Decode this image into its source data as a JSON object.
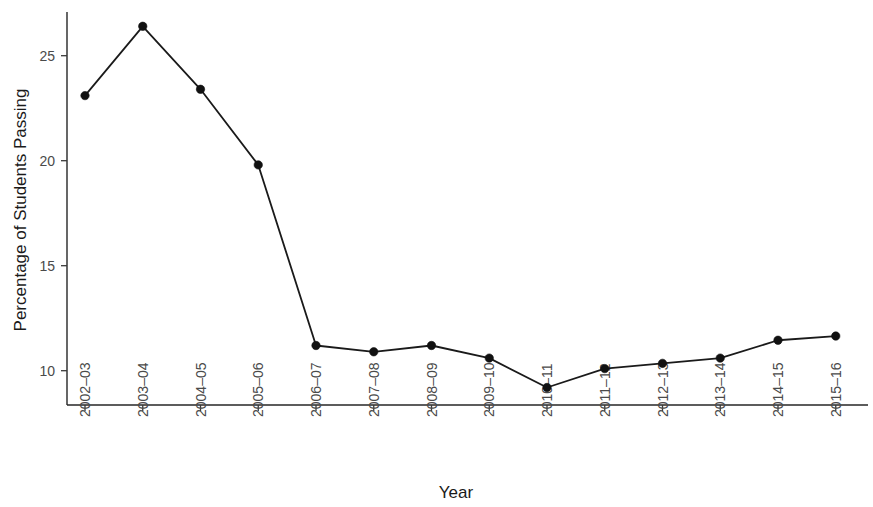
{
  "chart_data": {
    "type": "line",
    "title": "",
    "xlabel": "Year",
    "ylabel": "Percentage of Students Passing",
    "categories": [
      "2002–03",
      "2003–04",
      "2004–05",
      "2005–06",
      "2006–07",
      "2007–08",
      "2008–09",
      "2009–10",
      "2010–11",
      "2011–12",
      "2012–13",
      "2013–14",
      "2014–15",
      "2015–16"
    ],
    "values": [
      23.1,
      26.4,
      23.4,
      19.8,
      11.2,
      10.9,
      11.2,
      10.6,
      9.2,
      10.1,
      10.35,
      10.6,
      11.45,
      11.65
    ],
    "series": [
      {
        "name": "Percentage of Students Passing",
        "values": [
          23.1,
          26.4,
          23.4,
          19.8,
          11.2,
          10.9,
          11.2,
          10.6,
          9.2,
          10.1,
          10.35,
          10.6,
          11.45,
          11.65
        ]
      }
    ],
    "y_ticks": [
      10,
      15,
      20,
      25
    ],
    "y_tick_labels": [
      "10",
      "15",
      "20",
      "25"
    ],
    "ylim": [
      8.6,
      27.3
    ],
    "xlim_categories": 14,
    "grid": false,
    "legend": "none",
    "marker": "filled-circle",
    "line_color": "#1a1a1a",
    "marker_color": "#111111",
    "background_color": "#ffffff",
    "x_tick_label_rotation": -90
  },
  "axes": {
    "y_title": "Percentage of Students Passing",
    "x_title": "Year"
  }
}
